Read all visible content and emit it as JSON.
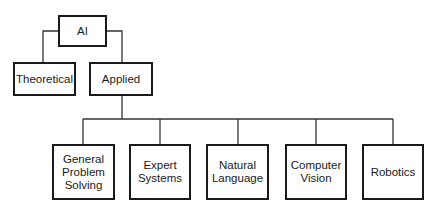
{
  "diagram": {
    "type": "tree",
    "root": {
      "id": "ai",
      "label": "AI"
    },
    "level1": [
      {
        "id": "theoretical",
        "label": "Theoretical"
      },
      {
        "id": "applied",
        "label": "Applied"
      }
    ],
    "level2": [
      {
        "id": "gps",
        "label": "General Problem Solving",
        "lines": [
          "General",
          "Problem",
          "Solving"
        ]
      },
      {
        "id": "expert",
        "label": "Expert Systems",
        "lines": [
          "Expert",
          "Systems"
        ]
      },
      {
        "id": "nl",
        "label": "Natural Language",
        "lines": [
          "Natural",
          "Language"
        ]
      },
      {
        "id": "cv",
        "label": "Computer Vision",
        "lines": [
          "Computer",
          "Vision"
        ]
      },
      {
        "id": "robotics",
        "label": "Robotics",
        "lines": [
          "Robotics"
        ]
      }
    ],
    "edges": [
      [
        "AI",
        "Theoretical"
      ],
      [
        "AI",
        "Applied"
      ],
      [
        "Applied",
        "General Problem Solving"
      ],
      [
        "Applied",
        "Expert Systems"
      ],
      [
        "Applied",
        "Natural Language"
      ],
      [
        "Applied",
        "Computer Vision"
      ],
      [
        "Applied",
        "Robotics"
      ]
    ]
  }
}
